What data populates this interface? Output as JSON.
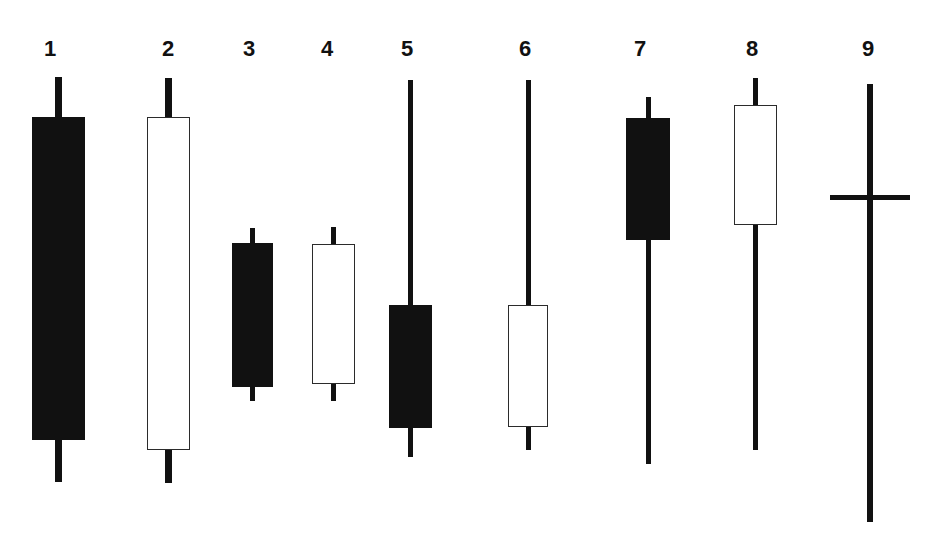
{
  "chart_data": {
    "type": "candlestick",
    "title": "",
    "subtitle": "",
    "xlabel": "",
    "ylabel": "",
    "grid": false,
    "legend": false,
    "axis_visible": false,
    "background_color": "#ffffff",
    "bearish_color": "#111111",
    "bullish_color": "#ffffff",
    "outline_color": "#2b2b2b",
    "categories": [
      "1",
      "2",
      "3",
      "4",
      "5",
      "6",
      "7",
      "8",
      "9"
    ],
    "pixel_coordinate_space": {
      "width": 946,
      "height": 557,
      "note": "y increases downward; price increases upward"
    },
    "candles": [
      {
        "label": "1",
        "type": "filled",
        "pattern": "long-black-body",
        "label_x": 50,
        "label_y": 38,
        "center_x": 58,
        "body_left": 32,
        "body_right": 85,
        "body_width": 53,
        "wick_top_y": 77,
        "body_top_y": 117,
        "body_bottom_y": 440,
        "wick_bottom_y": 482,
        "wick_width": 7
      },
      {
        "label": "2",
        "type": "hollow",
        "pattern": "long-white-body",
        "label_x": 168,
        "label_y": 38,
        "center_x": 168,
        "body_left": 147,
        "body_right": 190,
        "body_width": 43,
        "wick_top_y": 78,
        "body_top_y": 117,
        "body_bottom_y": 450,
        "wick_bottom_y": 483,
        "wick_width": 7
      },
      {
        "label": "3",
        "type": "filled",
        "pattern": "short-black-body",
        "label_x": 249,
        "label_y": 38,
        "center_x": 252,
        "body_left": 232,
        "body_right": 273,
        "body_width": 41,
        "wick_top_y": 228,
        "body_top_y": 243,
        "body_bottom_y": 387,
        "wick_bottom_y": 401,
        "wick_width": 5
      },
      {
        "label": "4",
        "type": "hollow",
        "pattern": "short-white-body",
        "label_x": 327,
        "label_y": 38,
        "center_x": 333,
        "body_left": 312,
        "body_right": 355,
        "body_width": 43,
        "wick_top_y": 227,
        "body_top_y": 244,
        "body_bottom_y": 384,
        "wick_bottom_y": 401,
        "wick_width": 5
      },
      {
        "label": "5",
        "type": "filled",
        "pattern": "black-body-long-upper-shadow",
        "label_x": 407,
        "label_y": 38,
        "center_x": 410,
        "body_left": 389,
        "body_right": 432,
        "body_width": 43,
        "wick_top_y": 80,
        "body_top_y": 305,
        "body_bottom_y": 428,
        "wick_bottom_y": 457,
        "wick_width": 5
      },
      {
        "label": "6",
        "type": "hollow",
        "pattern": "white-body-long-upper-shadow",
        "label_x": 525,
        "label_y": 38,
        "center_x": 528,
        "body_left": 508,
        "body_right": 548,
        "body_width": 40,
        "wick_top_y": 80,
        "body_top_y": 305,
        "body_bottom_y": 427,
        "wick_bottom_y": 450,
        "wick_width": 5
      },
      {
        "label": "7",
        "type": "filled",
        "pattern": "black-body-long-lower-shadow",
        "label_x": 640,
        "label_y": 38,
        "center_x": 648,
        "body_left": 626,
        "body_right": 670,
        "body_width": 44,
        "wick_top_y": 97,
        "body_top_y": 118,
        "body_bottom_y": 240,
        "wick_bottom_y": 464,
        "wick_width": 5
      },
      {
        "label": "8",
        "type": "hollow",
        "pattern": "white-body-long-lower-shadow",
        "label_x": 752,
        "label_y": 38,
        "center_x": 755,
        "body_left": 734,
        "body_right": 777,
        "body_width": 43,
        "wick_top_y": 78,
        "body_top_y": 105,
        "body_bottom_y": 225,
        "wick_bottom_y": 450,
        "wick_width": 5
      },
      {
        "label": "9",
        "type": "doji",
        "pattern": "long-legged-doji",
        "label_x": 868,
        "label_y": 38,
        "center_x": 870,
        "body_left": 830,
        "body_right": 910,
        "body_width": 80,
        "wick_top_y": 84,
        "body_top_y": 195,
        "body_bottom_y": 199,
        "wick_bottom_y": 522,
        "wick_width": 6,
        "crossbar_thickness": 5
      }
    ]
  }
}
